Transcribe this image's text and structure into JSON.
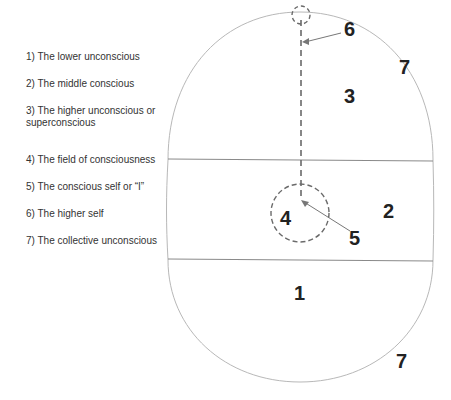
{
  "legend": {
    "items": [
      {
        "label": "1) The lower unconscious",
        "top": 0
      },
      {
        "label": "2) The middle conscious",
        "top": 27
      },
      {
        "label": "3) The higher unconscious or superconscious",
        "top": 54
      },
      {
        "label": "4) The field of consciousness",
        "top": 103
      },
      {
        "label": "5) The conscious self or “I”",
        "top": 130
      },
      {
        "label": "6) The higher self",
        "top": 157
      },
      {
        "label": "7) The collective unconscious",
        "top": 184
      }
    ]
  },
  "diagram": {
    "labels": {
      "n1": "1",
      "n2": "2",
      "n3": "3",
      "n4": "4",
      "n5": "5",
      "n6": "6",
      "n7_top": "7",
      "n7_bottom": "7"
    },
    "colors": {
      "outline": "#b0b0b0",
      "band_lines": "#8a8a8a",
      "dashed": "#6a6a6a",
      "text": "#222222"
    }
  }
}
